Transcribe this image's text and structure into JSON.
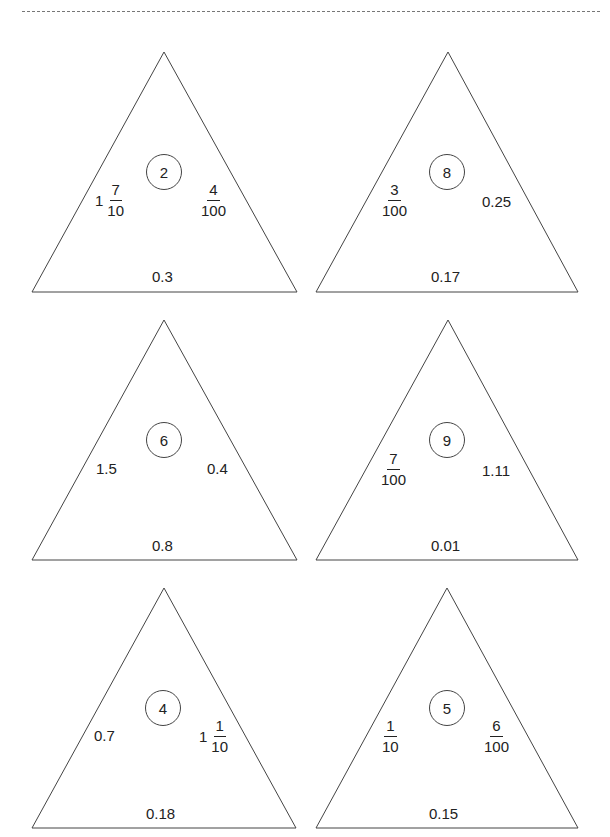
{
  "page": {
    "divider": "dashed-line"
  },
  "triangles": [
    {
      "center": "2",
      "left": {
        "type": "mixed",
        "whole": "1",
        "num": "7",
        "den": "10"
      },
      "right": {
        "type": "frac",
        "num": "4",
        "den": "100"
      },
      "bottom": "0.3"
    },
    {
      "center": "8",
      "left": {
        "type": "frac",
        "num": "3",
        "den": "100"
      },
      "right": {
        "type": "dec",
        "text": "0.25"
      },
      "bottom": "0.17"
    },
    {
      "center": "6",
      "left": {
        "type": "dec",
        "text": "1.5"
      },
      "right": {
        "type": "dec",
        "text": "0.4"
      },
      "bottom": "0.8"
    },
    {
      "center": "9",
      "left": {
        "type": "frac",
        "num": "7",
        "den": "100"
      },
      "right": {
        "type": "dec",
        "text": "1.11"
      },
      "bottom": "0.01"
    },
    {
      "center": "4",
      "left": {
        "type": "dec",
        "text": "0.7"
      },
      "right": {
        "type": "mixed",
        "whole": "1",
        "num": "1",
        "den": "10"
      },
      "bottom": "0.18"
    },
    {
      "center": "5",
      "left": {
        "type": "frac",
        "num": "1",
        "den": "10"
      },
      "right": {
        "type": "frac",
        "num": "6",
        "den": "100"
      },
      "bottom": "0.15"
    }
  ]
}
